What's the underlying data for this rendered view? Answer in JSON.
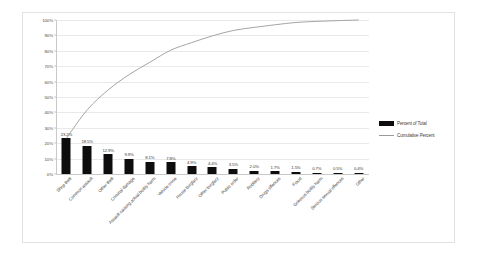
{
  "chart_data": {
    "type": "bar",
    "title": "",
    "subtitle": "",
    "xlabel": "",
    "ylabel": "",
    "ylim": [
      0,
      1.0
    ],
    "grid": true,
    "legend_position": "right",
    "ytick_labels": [
      "100%",
      "90%",
      "80%",
      "70%",
      "60%",
      "50%",
      "40%",
      "30%",
      "20%",
      "10%",
      "0%"
    ],
    "ytick_values": [
      100,
      90,
      80,
      70,
      60,
      50,
      40,
      30,
      20,
      10,
      0
    ],
    "categories": [
      "Shop theft",
      "Common assault",
      "Other theft",
      "Criminal damage",
      "Assault causing actual bodily harm",
      "Vehicle crime",
      "House burglary",
      "Other burglary",
      "Public order",
      "Robbery",
      "Drugs offences",
      "Fraud",
      "Grievous bodily harm",
      "Serious sexual offences",
      "Other"
    ],
    "series": [
      {
        "name": "Percent of Total",
        "type": "bar",
        "color": "#0d0d0d",
        "values": [
          23.2,
          18.5,
          12.9,
          9.9,
          8.1,
          7.8,
          4.9,
          4.4,
          3.5,
          2.0,
          1.7,
          1.5,
          0.7,
          0.5,
          0.4
        ],
        "labels": [
          "23.2%",
          "18.5%",
          "12.9%",
          "9.9%",
          "8.1%",
          "7.8%",
          "4.9%",
          "4.4%",
          "3.5%",
          "2.0%",
          "1.7%",
          "1.5%",
          "0.7%",
          "0.5%",
          "0.4%"
        ]
      },
      {
        "name": "Cumulative Percent",
        "type": "line",
        "color": "#9a9a9a",
        "values": [
          23.2,
          41.7,
          54.6,
          64.5,
          72.6,
          80.4,
          85.3,
          89.7,
          93.2,
          95.2,
          96.9,
          98.4,
          99.1,
          99.6,
          100.0
        ]
      }
    ]
  },
  "legend": {
    "items": [
      {
        "label": "Percent of Total",
        "marker": "bar",
        "color": "#0d0d0d"
      },
      {
        "label": "Cumulative Percent",
        "marker": "line",
        "color": "#9a9a9a"
      }
    ]
  }
}
